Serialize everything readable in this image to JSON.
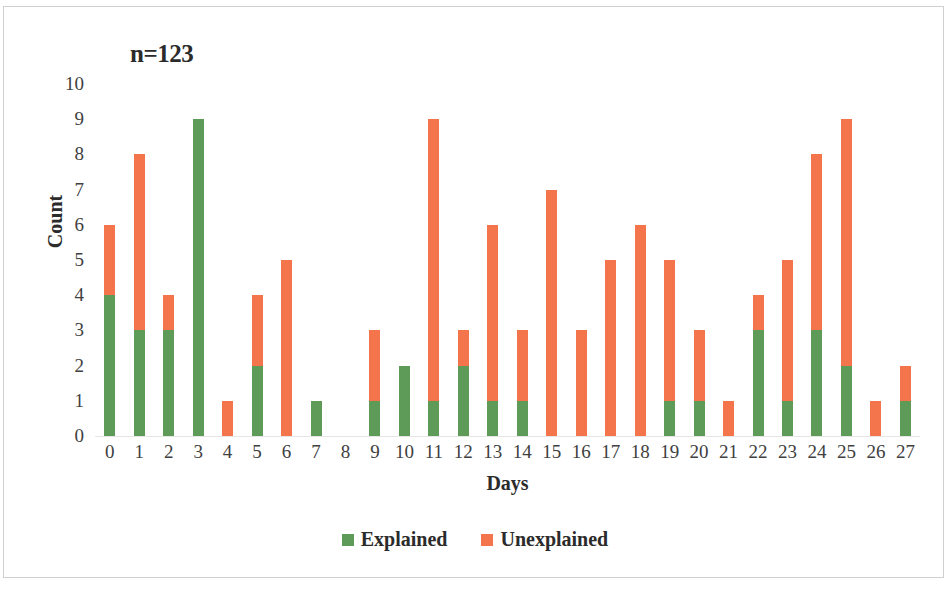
{
  "figure": {
    "title": "n=123",
    "frame_color": "#d0d0d0",
    "background": "#ffffff"
  },
  "legend": {
    "position": "bottom-center",
    "items": [
      {
        "label": "Explained",
        "color": "#5e9a58",
        "swatch_name": "legend-swatch-explained"
      },
      {
        "label": "Unexplained",
        "color": "#f4744c",
        "swatch_name": "legend-swatch-unexplained"
      }
    ]
  },
  "chart_data": {
    "type": "bar",
    "stacked": true,
    "title": "n=123",
    "xlabel": "Days",
    "ylabel": "Count",
    "ylim": [
      0,
      10
    ],
    "ytick_step": 1,
    "grid": false,
    "categories": [
      "0",
      "1",
      "2",
      "3",
      "4",
      "5",
      "6",
      "7",
      "8",
      "9",
      "10",
      "11",
      "12",
      "13",
      "14",
      "15",
      "16",
      "17",
      "18",
      "19",
      "20",
      "21",
      "22",
      "23",
      "24",
      "25",
      "26",
      "27"
    ],
    "ytick_labels": [
      "10",
      "9",
      "8",
      "7",
      "6",
      "5",
      "4",
      "3",
      "2",
      "1",
      "0"
    ],
    "series": [
      {
        "name": "Explained",
        "color": "#5e9a58",
        "values": [
          4,
          3,
          3,
          9,
          0,
          2,
          0,
          1,
          0,
          1,
          2,
          1,
          2,
          1,
          1,
          0,
          0,
          0,
          0,
          1,
          1,
          0,
          3,
          1,
          3,
          2,
          0,
          1
        ]
      },
      {
        "name": "Unexplained",
        "color": "#f4744c",
        "values": [
          2,
          5,
          1,
          0,
          1,
          2,
          5,
          0,
          0,
          2,
          0,
          8,
          1,
          5,
          2,
          7,
          3,
          5,
          6,
          4,
          2,
          1,
          1,
          4,
          5,
          7,
          1,
          1
        ]
      }
    ],
    "totals": [
      6,
      8,
      4,
      9,
      1,
      4,
      5,
      1,
      0,
      3,
      2,
      9,
      3,
      6,
      3,
      7,
      3,
      5,
      6,
      5,
      3,
      1,
      4,
      5,
      8,
      9,
      1,
      2
    ]
  }
}
